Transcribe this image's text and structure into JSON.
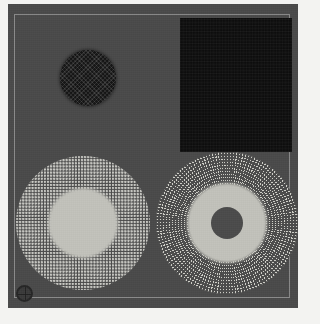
{
  "image": {
    "width": 320,
    "height": 324,
    "background_color": "#f3f3f1",
    "description": "Grayscale micrograph-style plate: a dark gray square panel containing four specimen regions"
  },
  "frame": {
    "name": "specimen-panel",
    "fill_color": "#4a4a4a",
    "left": 8,
    "top": 4,
    "width": 290,
    "height": 304,
    "inner_rule_color": "#bebebe"
  },
  "shapes": [
    {
      "id": "mesh-circle",
      "label": "dark mesh circle",
      "kind": "circle",
      "texture": "fine cross-hatch mesh",
      "fill_color": "#151515",
      "cx": 80,
      "cy": 78,
      "diameter": 56
    },
    {
      "id": "dark-rect",
      "label": "dark rectangle",
      "kind": "rectangle",
      "texture": "flat near-black noise",
      "fill_color": "#0e0e0e",
      "left": 180,
      "top": 18,
      "width": 112,
      "height": 134
    },
    {
      "id": "stipple-circle",
      "label": "stippled grid circle",
      "kind": "circle",
      "texture": "square grid of light dots with solid light core",
      "dot_color": "#c9c9c4",
      "core_color": "#c2c2bb",
      "cx": 83,
      "cy": 223,
      "diameter": 134,
      "core_diameter": 70
    },
    {
      "id": "radial-circle",
      "label": "radial sunburst circle",
      "kind": "circle",
      "texture": "radial spoke dot array with light core and dark center hole",
      "dot_color": "#cfcfc8",
      "core_color": "#c2c2bb",
      "hole_color": "#4b4b4b",
      "cx": 227,
      "cy": 223,
      "diameter": 142,
      "core_diameter": 80,
      "hole_diameter": 33
    },
    {
      "id": "corner-ring",
      "label": "corner registration ring",
      "kind": "ring",
      "fill_color": "#3a3a3a",
      "stroke_color": "#262626",
      "cx": 17,
      "cy": 294,
      "diameter": 17
    }
  ]
}
